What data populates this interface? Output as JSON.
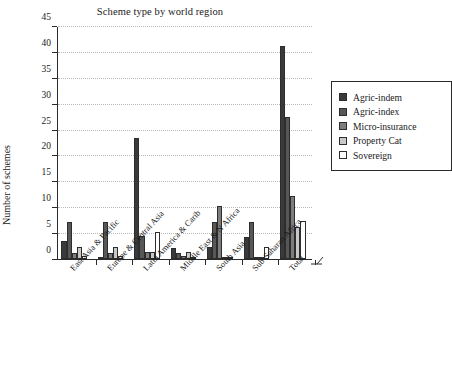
{
  "chart_data": {
    "type": "bar",
    "title": "Scheme type by world region",
    "xlabel": "",
    "ylabel": "Number of schemes",
    "ylim": [
      0,
      45
    ],
    "ytick_step": 5,
    "yticks": [
      0,
      5,
      10,
      15,
      20,
      25,
      30,
      35,
      40,
      45
    ],
    "grid": true,
    "legend_position": "right",
    "categories": [
      "East Asia & Pacific",
      "Europe & Central Asia",
      "Latin America & Carib",
      "Middle East & N Africa",
      "South Asia",
      "Sub-Saharan Africa",
      "Total"
    ],
    "series": [
      {
        "name": "Agric-indem",
        "color": "#3a3a3a",
        "values": [
          3.4,
          0.3,
          23.4,
          2.2,
          2.3,
          4.2,
          41.2
        ]
      },
      {
        "name": "Agric-index",
        "color": "#575757",
        "values": [
          7.2,
          7.2,
          4.4,
          1.2,
          7.2,
          7.2,
          27.4
        ]
      },
      {
        "name": "Micro-insurance",
        "color": "#7d7d7d",
        "values": [
          1.2,
          1.2,
          1.4,
          0.6,
          10.3,
          0.3,
          12.1
        ]
      },
      {
        "name": "Property Cat",
        "color": "#c8c8c8",
        "values": [
          2.3,
          2.4,
          1.3,
          1.3,
          0.3,
          0.3,
          6.1
        ]
      },
      {
        "name": "Sovereign",
        "color": "#ffffff",
        "values": [
          0.6,
          0.6,
          5.3,
          0.4,
          0.4,
          2.3,
          7.3
        ]
      }
    ]
  },
  "legend": {
    "items": [
      {
        "label": "Agric-indem",
        "color": "#3a3a3a"
      },
      {
        "label": "Agric-index",
        "color": "#575757"
      },
      {
        "label": "Micro-insurance",
        "color": "#7d7d7d"
      },
      {
        "label": "Property Cat",
        "color": "#c8c8c8"
      },
      {
        "label": "Sovereign",
        "color": "#ffffff"
      }
    ]
  }
}
